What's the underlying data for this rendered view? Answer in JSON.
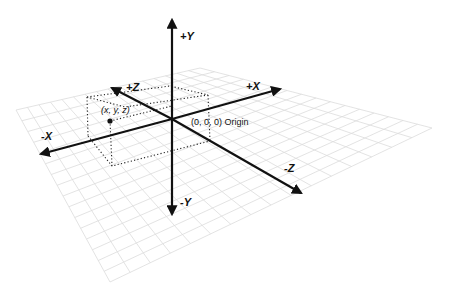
{
  "diagram": {
    "labels": {
      "pos_y": "+Y",
      "neg_y": "-Y",
      "pos_x": "+X",
      "neg_x": "-X",
      "pos_z": "+Z",
      "neg_z": "-Z",
      "origin": "(0, 0, 0) Origin",
      "point": "(x, y, z)"
    },
    "colors": {
      "axis": "#111111",
      "grid": "#dcdcdc",
      "dotted_box": "#222222",
      "background": "#ffffff"
    }
  }
}
